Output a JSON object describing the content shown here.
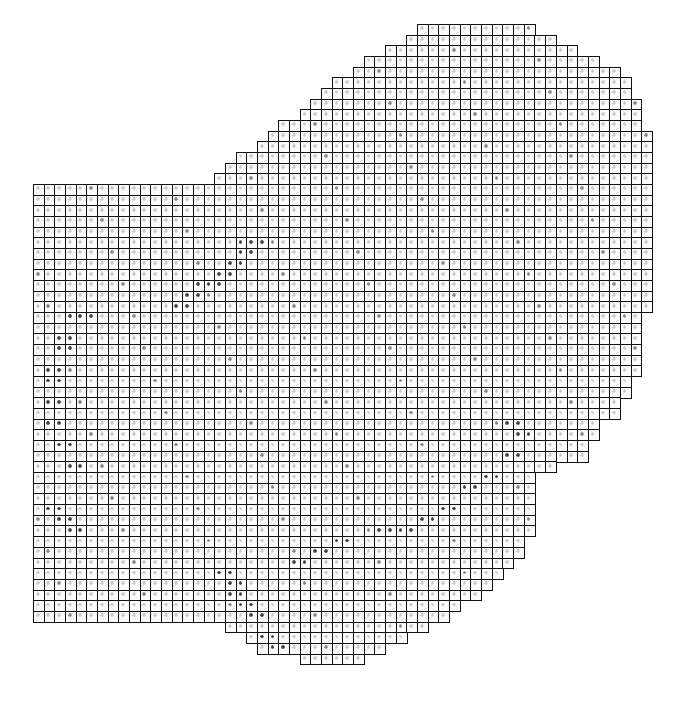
{
  "diagram": {
    "type": "cellular-grid-map",
    "grid": {
      "origin_x": 33,
      "origin_y": 24,
      "pitch": 10.67,
      "cols": 58,
      "rows": 61
    },
    "colors": {
      "border": "#111111",
      "cell_fill": "#fbfbfb",
      "dot_light": "#bdbdbd",
      "dot_dark": "#2a2a2a",
      "background": "#ffffff"
    },
    "row_spans": [
      [
        36,
        47
      ],
      [
        35,
        49
      ],
      [
        33,
        51
      ],
      [
        31,
        53
      ],
      [
        30,
        55
      ],
      [
        28,
        56
      ],
      [
        27,
        56
      ],
      [
        26,
        57
      ],
      [
        25,
        57
      ],
      [
        23,
        57
      ],
      [
        22,
        58
      ],
      [
        21,
        58
      ],
      [
        19,
        58
      ],
      [
        18,
        58
      ],
      [
        17,
        58
      ],
      [
        0,
        58
      ],
      [
        0,
        58
      ],
      [
        0,
        58
      ],
      [
        0,
        58
      ],
      [
        0,
        58
      ],
      [
        0,
        58
      ],
      [
        0,
        58
      ],
      [
        0,
        58
      ],
      [
        0,
        58
      ],
      [
        0,
        58
      ],
      [
        0,
        58
      ],
      [
        0,
        58
      ],
      [
        0,
        57
      ],
      [
        0,
        57
      ],
      [
        0,
        57
      ],
      [
        0,
        57
      ],
      [
        0,
        57
      ],
      [
        0,
        57
      ],
      [
        0,
        56
      ],
      [
        0,
        56
      ],
      [
        0,
        55
      ],
      [
        0,
        55
      ],
      [
        0,
        53
      ],
      [
        0,
        53
      ],
      [
        0,
        52
      ],
      [
        0,
        52
      ],
      [
        0,
        49
      ],
      [
        0,
        47
      ],
      [
        0,
        47
      ],
      [
        0,
        47
      ],
      [
        0,
        47
      ],
      [
        0,
        47
      ],
      [
        0,
        47
      ],
      [
        0,
        46
      ],
      [
        0,
        46
      ],
      [
        0,
        45
      ],
      [
        0,
        44
      ],
      [
        0,
        43
      ],
      [
        0,
        42
      ],
      [
        0,
        40
      ],
      [
        0,
        39
      ],
      [
        18,
        37
      ],
      [
        20,
        35
      ],
      [
        21,
        33
      ],
      [
        25,
        31
      ],
      [
        28,
        28
      ]
    ],
    "dark_bands": [
      {
        "name": "upper-diagonal",
        "cells": [
          [
            19,
            20
          ],
          [
            20,
            20
          ],
          [
            19,
            21
          ],
          [
            18,
            22
          ],
          [
            17,
            23
          ],
          [
            16,
            24
          ],
          [
            15,
            24
          ],
          [
            14,
            25
          ],
          [
            13,
            26
          ]
        ]
      },
      {
        "name": "left-arc",
        "cells": [
          [
            3,
            27
          ],
          [
            4,
            27
          ],
          [
            2,
            29
          ],
          [
            2,
            30
          ],
          [
            1,
            32
          ],
          [
            1,
            33
          ],
          [
            1,
            35
          ],
          [
            1,
            37
          ],
          [
            2,
            39
          ],
          [
            3,
            41
          ],
          [
            1,
            45
          ],
          [
            2,
            46
          ],
          [
            3,
            47
          ]
        ]
      },
      {
        "name": "lower-arc",
        "cells": [
          [
            17,
            51
          ],
          [
            18,
            52
          ],
          [
            18,
            53
          ],
          [
            19,
            54
          ],
          [
            20,
            55
          ],
          [
            21,
            57
          ],
          [
            22,
            58
          ],
          [
            24,
            50
          ],
          [
            26,
            49
          ],
          [
            28,
            48
          ]
        ]
      },
      {
        "name": "right-band",
        "cells": [
          [
            44,
            37
          ],
          [
            45,
            38
          ],
          [
            44,
            40
          ],
          [
            42,
            42
          ],
          [
            40,
            43
          ],
          [
            38,
            45
          ],
          [
            36,
            46
          ],
          [
            34,
            47
          ],
          [
            32,
            47
          ]
        ]
      }
    ]
  }
}
